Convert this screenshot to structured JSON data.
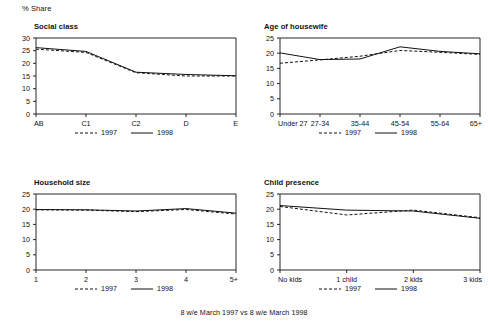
{
  "axis_unit_label": "% Share",
  "footer": "8 w/e March 1997 vs 8 w/e March 1998",
  "legend": {
    "series_1997": "1997",
    "series_1998": "1998"
  },
  "colors": {
    "ink": "#111111",
    "background": "#ffffff"
  },
  "chart_data": [
    {
      "type": "line",
      "title": "Social class",
      "xlabel": "",
      "ylabel": "% Share",
      "categories": [
        "AB",
        "C1",
        "C2",
        "D",
        "E"
      ],
      "ylim": [
        0,
        30
      ],
      "yticks": [
        0,
        5,
        10,
        15,
        20,
        25,
        30
      ],
      "grid": false,
      "legend_position": "bottom",
      "series": [
        {
          "name": "1997",
          "style": "dashed",
          "values": [
            25.6,
            24.3,
            16.3,
            15.0,
            15.0
          ]
        },
        {
          "name": "1998",
          "style": "solid",
          "values": [
            26.2,
            24.7,
            16.5,
            15.6,
            15.1
          ]
        }
      ]
    },
    {
      "type": "line",
      "title": "Age of housewife",
      "xlabel": "",
      "ylabel": "% Share",
      "categories": [
        "Under 27",
        "27-34",
        "35-44",
        "45-54",
        "55-64",
        "65+"
      ],
      "ylim": [
        0,
        25
      ],
      "yticks": [
        0,
        5,
        10,
        15,
        20,
        25
      ],
      "grid": false,
      "legend_position": "bottom",
      "series": [
        {
          "name": "1997",
          "style": "dashed",
          "values": [
            16.7,
            17.8,
            19.0,
            20.9,
            20.3,
            19.6
          ]
        },
        {
          "name": "1998",
          "style": "solid",
          "values": [
            20.1,
            17.9,
            18.1,
            22.1,
            20.6,
            19.8
          ]
        }
      ]
    },
    {
      "type": "line",
      "title": "Household size",
      "xlabel": "",
      "ylabel": "% Share",
      "categories": [
        "1",
        "2",
        "3",
        "4",
        "5+"
      ],
      "ylim": [
        0,
        25
      ],
      "yticks": [
        0,
        5,
        10,
        15,
        20,
        25
      ],
      "grid": false,
      "legend_position": "bottom",
      "series": [
        {
          "name": "1997",
          "style": "dashed",
          "values": [
            19.8,
            19.7,
            19.2,
            19.9,
            18.4
          ]
        },
        {
          "name": "1998",
          "style": "solid",
          "values": [
            19.9,
            19.8,
            19.4,
            20.2,
            18.7
          ]
        }
      ]
    },
    {
      "type": "line",
      "title": "Child presence",
      "xlabel": "",
      "ylabel": "% Share",
      "categories": [
        "No kids",
        "1 child",
        "2 kids",
        "3 kids"
      ],
      "ylim": [
        0,
        25
      ],
      "yticks": [
        0,
        5,
        10,
        15,
        20,
        25
      ],
      "grid": false,
      "legend_position": "bottom",
      "series": [
        {
          "name": "1997",
          "style": "dashed",
          "values": [
            20.9,
            18.1,
            19.7,
            17.2
          ]
        },
        {
          "name": "1998",
          "style": "solid",
          "values": [
            21.2,
            19.7,
            19.4,
            17.0
          ]
        }
      ]
    }
  ]
}
